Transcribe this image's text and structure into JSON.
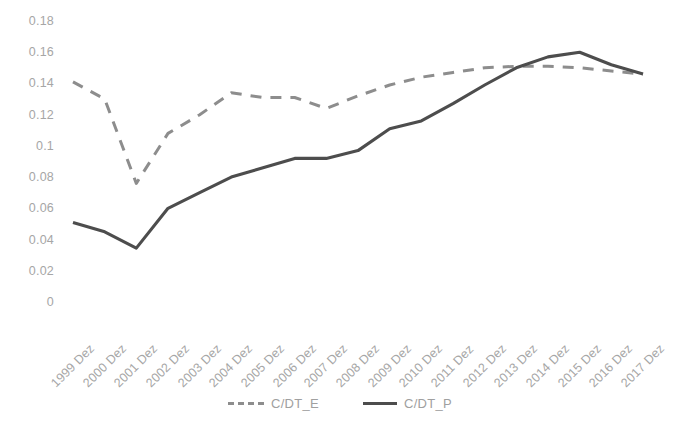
{
  "chart_data": {
    "type": "line",
    "title": "",
    "subtitle": "",
    "xlabel": "",
    "ylabel": "",
    "grid": false,
    "legend_position": "bottom",
    "ylim": [
      0,
      0.18
    ],
    "ytick_labels": [
      "0.18",
      "0.16",
      "0.14",
      "0.12",
      "0.1",
      "0.08",
      "0.06",
      "0.04",
      "0.02",
      "0"
    ],
    "ytick_values": [
      0.18,
      0.16,
      0.14,
      0.12,
      0.1,
      0.08,
      0.06,
      0.04,
      0.02,
      0
    ],
    "categories": [
      "1999 Dez",
      "2000 Dez",
      "2001 Dez",
      "2002 Dez",
      "2003 Dez",
      "2004 Dez",
      "2005 Dez",
      "2006 Dez",
      "2007 Dez",
      "2008 Dez",
      "2009 Dez",
      "2010 Dez",
      "2011 Dez",
      "2012 Dez",
      "2013 Dez",
      "2014 Dez",
      "2015 Dez",
      "2016 Dez",
      "2017 Dez"
    ],
    "series": [
      {
        "name": "C/DT_E",
        "style": "dashed",
        "color": "#8d8d8d",
        "values": [
          0.141,
          0.13,
          0.076,
          0.108,
          0.12,
          0.134,
          0.131,
          0.131,
          0.124,
          0.132,
          0.139,
          0.144,
          0.147,
          0.15,
          0.151,
          0.151,
          0.15,
          0.148,
          0.146
        ]
      },
      {
        "name": "C/DT_P",
        "style": "solid",
        "color": "#4d4d4d",
        "values": [
          0.051,
          0.045,
          0.0345,
          0.06,
          0.07,
          0.08,
          0.086,
          0.092,
          0.092,
          0.097,
          0.111,
          0.116,
          0.127,
          0.139,
          0.15,
          0.157,
          0.16,
          0.152,
          0.146
        ]
      }
    ]
  },
  "legend": {
    "entries": [
      {
        "label": "C/DT_E"
      },
      {
        "label": "C/DT_P"
      }
    ]
  },
  "colors": {
    "series_e": "#8d8d8d",
    "series_p": "#4d4d4d",
    "tick_text": "#a6a6a6",
    "background": "#ffffff"
  }
}
